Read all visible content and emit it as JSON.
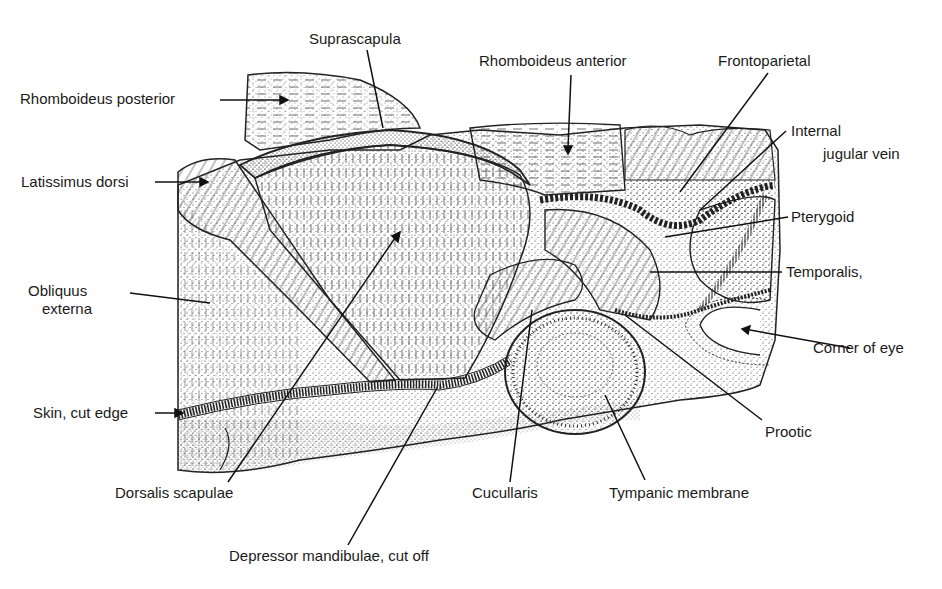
{
  "figure": {
    "labels": {
      "suprascapula": "Suprascapula",
      "rhomboideus_posterior": "Rhomboideus posterior",
      "rhomboideus_anterior": "Rhomboideus anterior",
      "frontoparietal": "Frontoparietal",
      "internal_jugular_vein_1": "Internal",
      "internal_jugular_vein_2": "jugular vein",
      "latissimus_dorsi": "Latissimus dorsi",
      "pterygoid": "Pterygoid",
      "temporalis": "Temporalis,",
      "obliquus_externa_1": "Obliquus",
      "obliquus_externa_2": "externa",
      "corner_of_eye": "Corner of eye",
      "skin_cut_edge": "Skin, cut edge",
      "prootic": "Prootic",
      "dorsalis_scapulae": "Dorsalis scapulae",
      "cucullaris": "Cucullaris",
      "tympanic_membrane": "Tympanic membrane",
      "depressor_mandibulae": "Depressor mandibulae, cut off"
    }
  }
}
